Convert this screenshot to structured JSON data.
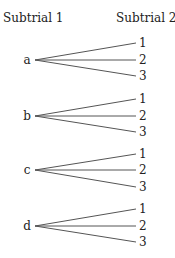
{
  "headers": {
    "left": "Subtrial 1",
    "right": "Subtrial 2"
  },
  "tree": {
    "nodes": [
      {
        "label": "a",
        "children": [
          "1",
          "2",
          "3"
        ]
      },
      {
        "label": "b",
        "children": [
          "1",
          "2",
          "3"
        ]
      },
      {
        "label": "c",
        "children": [
          "1",
          "2",
          "3"
        ]
      },
      {
        "label": "d",
        "children": [
          "1",
          "2",
          "3"
        ]
      }
    ]
  },
  "colors": {
    "line": "#555555",
    "text": "#222222"
  }
}
